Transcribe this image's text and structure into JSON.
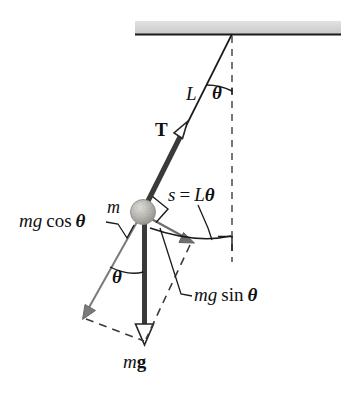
{
  "figure": {
    "type": "physics-diagram"
  },
  "labels": {
    "length": "L",
    "angle_top": "θ",
    "tension": "T",
    "arc_length": "s = Lθ",
    "arc_length_parts": {
      "s": "s",
      "eq": "=",
      "L": "L",
      "theta": "θ"
    },
    "mass": "m",
    "mg_cos": {
      "mg": "mg",
      "fn": "cos",
      "theta": "θ"
    },
    "angle_mid": "θ",
    "mg_sin": {
      "mg": "mg",
      "fn": "sin",
      "theta": "θ"
    },
    "weight": {
      "m": "m",
      "g": "g"
    }
  },
  "geometry": {
    "pivot": {
      "x": 232,
      "y": 34
    },
    "bob": {
      "x": 143,
      "y": 212,
      "r": 12
    },
    "string_angle_deg": 26.6,
    "ceiling": {
      "x1": 135,
      "x2": 341,
      "y": 34,
      "thickness": 12
    },
    "vertical_dashed": {
      "x": 232,
      "y1": 34,
      "y2": 262
    },
    "tension_arrow_tip": {
      "x": 180,
      "y": 126
    },
    "mg_arrow_tip": {
      "x": 145,
      "y": 341
    },
    "mgcos_arrow_tip": {
      "x": 84,
      "y": 317
    },
    "mgsin_arrow_tip": {
      "x": 192,
      "y": 243
    },
    "arc_end": {
      "x": 232,
      "y": 236
    }
  },
  "colors": {
    "ink": "#1a1a1a",
    "ceiling_fill": "#d8d8d8",
    "bob_fill": "#b8b6b2",
    "arrow_gray": "#6e6e6e",
    "thick_arrow": "#3a3a38",
    "dash": "#4a4a4a",
    "background": "#ffffff"
  }
}
